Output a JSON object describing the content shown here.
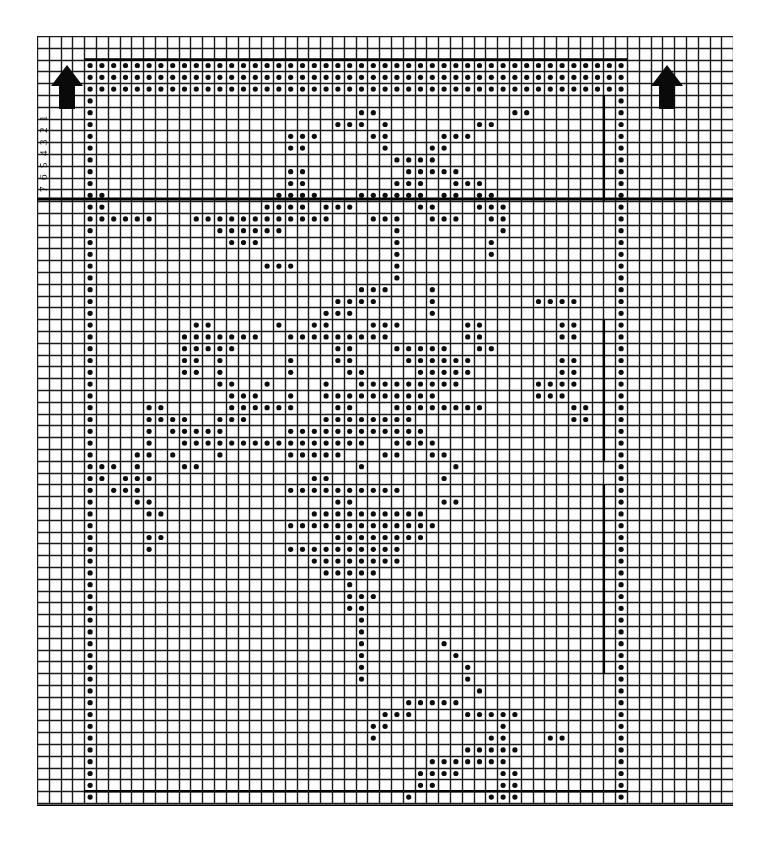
{
  "chart_data": {
    "type": "heatmap",
    "title": "",
    "subtitle": "",
    "xlabel": "",
    "ylabel": "",
    "notation": "filled-dot = filled mesh square; empty = open mesh square",
    "grid": true,
    "legend_position": "none",
    "grid_columns": 59,
    "grid_rows": 65,
    "cell_px": 11.8,
    "outer_grid": {
      "left": 37,
      "top": 36,
      "right": 733,
      "bottom": 806,
      "columns": 59,
      "rows": 65,
      "line_color": "#1a1a1a",
      "line_width": 1.4
    },
    "pattern_origin": {
      "col": 4,
      "row": 2
    },
    "pattern_cols": 46,
    "pattern_rows": 62,
    "heavy_lines": {
      "horizontal_y": [
        199,
        806
      ],
      "vertical_x": [],
      "color": "#000000",
      "width": 3
    },
    "row_labels": [
      "1",
      "2",
      "3",
      "4",
      "5",
      "6",
      "7"
    ],
    "row_label_orientation": "rotated-180",
    "arrows": [
      {
        "name": "repeat-arrow-left",
        "x": 50,
        "y": 64,
        "direction": "up"
      },
      {
        "name": "repeat-arrow-right",
        "x": 650,
        "y": 64,
        "direction": "up"
      }
    ],
    "dot_color": "#0d0d0d",
    "dot_radius": 2.6,
    "background": "#ffffff",
    "rows_data": [
      "1111111111111111111111111111111111111111111111",
      "1111111111111111111111111111111111111111111111",
      "1111111111111111111111111111111111111111111111",
      "1000000000000000000000000000000000000000000001",
      "1000000000000000000000011000000000001100000001",
      "1000000000000000000001110100000001100000000001",
      "1000000000000000011100001100001110000000000001",
      "1000000000000000011000000100011000000000000001",
      "1000000000000000000000000011110000000000000001",
      "1000000000000000011000000001111100000000000001",
      "1000000000000000011000000011100111000000000001",
      "1100000000000000111100011111101101100000000001",
      "1100000000000001111011100000110001110000000001",
      "1111110001111111111110001110011100110000000001",
      "1000000000011111100000000010000000010000000001",
      "1000000000001110000000000010000000100000000001",
      "1000000000000000000000000010000000100000000001",
      "1000000000000001110000000010000000000000000001",
      "1000000000000000000000000010000000000000000001",
      "1000000000000000000000011100010000000000000001",
      "1000000000000000000001111000010000000011110001",
      "1000000000000000000011100000010000000000000001",
      "1000000001100000100110001110000011000000110001",
      "1000000011111110011111111100000011000000110001",
      "1000000011111000000001100011111001100000000001",
      "1000000011010000010001100001111110000000110001",
      "1000000011010000010000110000111110000000110001",
      "1000000000011001000010011111111100000011110001",
      "1000000000001110010011111111110000000011100001",
      "1000011000001111110001100011111111000000011001",
      "1000011110011100000011111111000000000000011001",
      "1000010111110000011111111111100000000000000001",
      "1000010011111111111111110011110000000000000001",
      "1000110100010000011111000110011000000000000001",
      "1110100011000000000000010000000100000000000001",
      "1101110000000000000110000000001000000000000001",
      "1011100000000000011111111110000000000000000001",
      "1000110000000000000001100000001100000000000001",
      "1000011000000000000111111111100000000000000001",
      "1000000000000000011111111111110000000000000001",
      "1000011000000000000001111111100000000000000001",
      "1000010000000000011111111110000000000000000001",
      "1000000000000000000111111110000000000000000001",
      "1000000000000000000011111000000000000000000001",
      "1000000000000000000000100000000000000000000001",
      "1000000000000000000000111000000000000000000001",
      "1000000000000000000000110000000000000000000001",
      "1000000000000000000000010000000000000000000001",
      "1000000000000000000000010000000000000000000001",
      "1000000000000000000000010000001000000000000001",
      "1000000000000000000000010000000100000000000001",
      "1000000000000000000000010000000010000000000001",
      "1000000000000000000000010000000010000000000001",
      "1000000000000000000000000000000001000000000001",
      "1000000000000000000000000001111100000000000001",
      "1000000000000000000000000111000011111000000001",
      "1000000000000000000000001100000000010000000001",
      "1000000000000000000000001000000000110001100001",
      "1000000000000000000000000000000011111000000001",
      "1000000000000000000000000000011111110000000001",
      "1000000000000000000000000000111100011000000001",
      "1000000000000000000000000000110000011000000001",
      "1000000000000000000000000001000000111000000001",
      "1111111111111111111111111111111111111111111111",
      "1111111111111111111111111111111111111111111111",
      "1111111111111111111111111111111111111111111111"
    ]
  }
}
